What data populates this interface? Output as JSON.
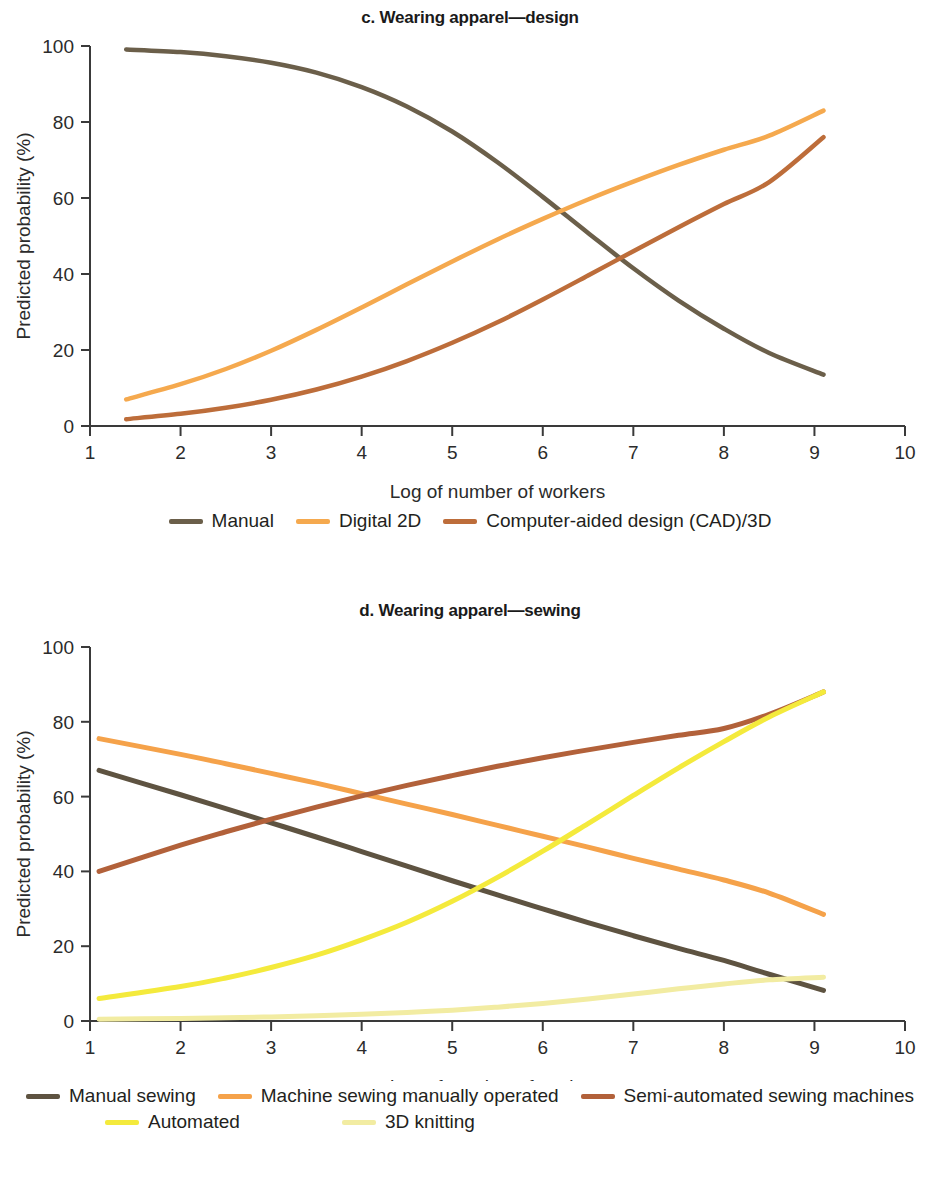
{
  "figure": {
    "background": "#ffffff"
  },
  "panels": [
    {
      "id": "c",
      "title": "c. Wearing apparel—design",
      "chart_data": {
        "type": "line",
        "title": "c. Wearing apparel—design",
        "xlabel": "Log of number of workers",
        "ylabel": "Predicted probability (%)",
        "xlim": [
          1,
          10
        ],
        "ylim": [
          0,
          100
        ],
        "xticks": [
          1,
          2,
          3,
          4,
          5,
          6,
          7,
          8,
          9,
          10
        ],
        "yticks": [
          0,
          20,
          40,
          60,
          80,
          100
        ],
        "grid": false,
        "legend_position": "bottom",
        "x": [
          1.4,
          2.0,
          2.5,
          3.0,
          3.5,
          4.0,
          4.5,
          5.0,
          5.5,
          6.0,
          6.5,
          7.0,
          7.5,
          8.0,
          8.5,
          9.1
        ],
        "series": [
          {
            "name": "Manual",
            "color": "#6b5f4a",
            "values": [
              99.1,
              98.4,
              97.3,
              95.6,
              93.0,
              89.2,
              84.1,
              77.5,
              69.4,
              60.3,
              50.8,
              41.5,
              33.0,
              25.6,
              19.2,
              13.5
            ]
          },
          {
            "name": "Digital 2D",
            "color": "#f5a94e",
            "values": [
              7.0,
              11.0,
              15.0,
              19.8,
              25.3,
              31.2,
              37.3,
              43.3,
              49.1,
              54.5,
              59.6,
              64.3,
              68.7,
              72.7,
              76.4,
              83.0
            ]
          },
          {
            "name": "Computer-aided design (CAD)/3D",
            "color": "#bd6d3a",
            "values": [
              1.8,
              3.2,
              4.8,
              6.9,
              9.6,
              13.0,
              17.1,
              21.9,
              27.3,
              33.3,
              39.6,
              46.0,
              52.3,
              58.4,
              64.2,
              76.0
            ]
          }
        ]
      },
      "legend": [
        {
          "label": "Manual",
          "color": "#6b5f4a"
        },
        {
          "label": "Digital 2D",
          "color": "#f5a94e"
        },
        {
          "label": "Computer-aided design (CAD)/3D",
          "color": "#bd6d3a"
        }
      ]
    },
    {
      "id": "d",
      "title": "d. Wearing apparel—sewing",
      "chart_data": {
        "type": "line",
        "title": "d. Wearing apparel—sewing",
        "xlabel": "Log of number of workers",
        "ylabel": "Predicted probability (%)",
        "xlim": [
          1,
          10
        ],
        "ylim": [
          0,
          100
        ],
        "xticks": [
          1,
          2,
          3,
          4,
          5,
          6,
          7,
          8,
          9,
          10
        ],
        "yticks": [
          0,
          20,
          40,
          60,
          80,
          100
        ],
        "grid": false,
        "legend_position": "bottom",
        "x": [
          1.1,
          2.0,
          2.5,
          3.0,
          3.5,
          4.0,
          4.5,
          5.0,
          5.5,
          6.0,
          6.5,
          7.0,
          7.5,
          8.0,
          8.5,
          9.1
        ],
        "series": [
          {
            "name": "Manual sewing",
            "color": "#5e5341",
            "values": [
              67.0,
              60.5,
              56.8,
              53.0,
              49.2,
              45.3,
              41.4,
              37.5,
              33.7,
              30.0,
              26.3,
              22.8,
              19.4,
              16.2,
              12.5,
              8.2
            ]
          },
          {
            "name": "Machine sewing manually operated",
            "color": "#f5a24a",
            "values": [
              75.5,
              71.3,
              68.8,
              66.2,
              63.6,
              60.8,
              58.0,
              55.2,
              52.3,
              49.4,
              46.5,
              43.5,
              40.6,
              37.7,
              34.2,
              28.5
            ]
          },
          {
            "name": "Semi-automated sewing machines",
            "color": "#b2613a",
            "values": [
              40.0,
              47.0,
              50.6,
              54.0,
              57.2,
              60.2,
              63.0,
              65.6,
              68.1,
              70.4,
              72.5,
              74.5,
              76.4,
              78.2,
              82.0,
              88.0
            ]
          },
          {
            "name": "Automated",
            "color": "#f4ea3c",
            "values": [
              6.0,
              9.2,
              11.5,
              14.3,
              17.6,
              21.7,
              26.4,
              32.0,
              38.4,
              45.4,
              52.8,
              60.3,
              67.7,
              74.7,
              81.3,
              88.0
            ]
          },
          {
            "name": "3D knitting",
            "color": "#f2eca2",
            "values": [
              0.5,
              0.7,
              0.9,
              1.1,
              1.4,
              1.8,
              2.3,
              2.9,
              3.7,
              4.7,
              5.9,
              7.2,
              8.6,
              9.9,
              11.0,
              11.7
            ]
          }
        ]
      },
      "legend_rows": [
        [
          {
            "label": "Manual sewing",
            "color": "#5e5341"
          },
          {
            "label": "Machine sewing manually operated",
            "color": "#f5a24a"
          },
          {
            "label": "Semi-automated sewing machines",
            "color": "#b2613a"
          }
        ],
        [
          {
            "label": "Automated",
            "color": "#f4ea3c"
          },
          {
            "label": "3D knitting",
            "color": "#f2eca2"
          }
        ]
      ]
    }
  ]
}
